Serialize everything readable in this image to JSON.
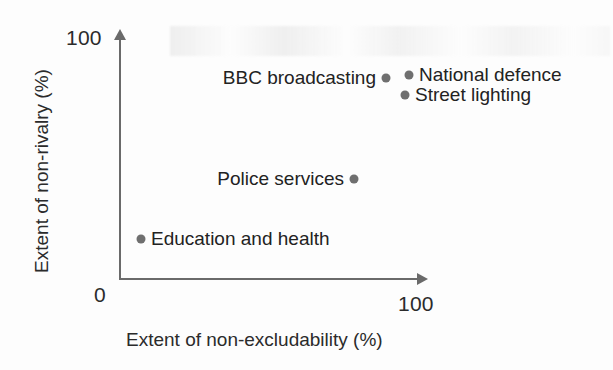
{
  "chart_data": {
    "type": "scatter",
    "title": "",
    "xlabel": "Extent of non-excludability (%)",
    "ylabel": "Extent of non-rivalry (%)",
    "xlim": [
      0,
      100
    ],
    "ylim": [
      0,
      100
    ],
    "xticks": [
      "0",
      "100"
    ],
    "yticks": [
      "100"
    ],
    "origin_label": "0",
    "grid": false,
    "legend": "none",
    "point_color": "#6f6f6f",
    "axis_color": "#6a6a6a",
    "text_color": "#222222",
    "points": [
      {
        "label": "Education and health",
        "x": 7,
        "y": 16,
        "px": 141,
        "py": 239,
        "label_side": "right"
      },
      {
        "label": "Police services",
        "x": 77,
        "y": 41,
        "px": 354,
        "py": 179,
        "label_side": "left"
      },
      {
        "label": "BBC broadcasting",
        "x": 88,
        "y": 82,
        "px": 386,
        "py": 78,
        "label_side": "left"
      },
      {
        "label": "National defence",
        "x": 96,
        "y": 83,
        "px": 409,
        "py": 75,
        "label_side": "right"
      },
      {
        "label": "Street lighting",
        "x": 95,
        "y": 75,
        "px": 405,
        "py": 95,
        "label_side": "right"
      }
    ]
  },
  "axes": {
    "y_tick_top": "100",
    "x_tick_right": "100",
    "origin": "0",
    "x_title": "Extent of non-excludability (%)",
    "y_title": "Extent of non-rivalry (%)"
  }
}
